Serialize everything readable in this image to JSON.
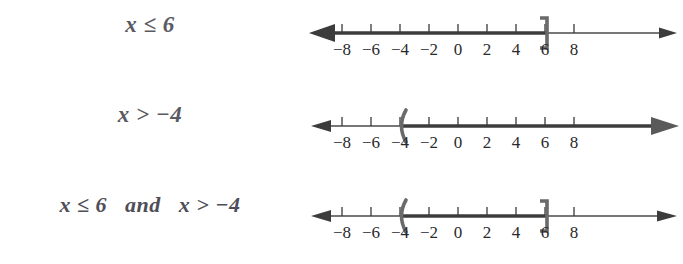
{
  "page": {
    "background_color": "#ffffff",
    "width": 683,
    "height": 264
  },
  "colors": {
    "expression_text": "#5a5a62",
    "axis_line": "#4a4a4a",
    "tick_label": "#2a2a2e",
    "highlight": "#3c3c3c",
    "bracket": "#6a6a6a"
  },
  "axis": {
    "tick_values": [
      -8,
      -6,
      -4,
      -2,
      0,
      2,
      4,
      6,
      8
    ],
    "tick_labels": [
      "−8",
      "−6",
      "−4",
      "−2",
      "0",
      "2",
      "4",
      "6",
      "8"
    ],
    "min_shown": -9.5,
    "max_shown": 9.5
  },
  "rows": [
    {
      "id": "row-0",
      "expression": "x ≤ 6",
      "inequality": {
        "variable": "x",
        "relation": "≤",
        "value": 6
      },
      "graph": {
        "type": "ray-left",
        "endpoint": 6,
        "endpoint_marker": "closed-bracket-right",
        "direction": "left",
        "arrow_left": true,
        "arrow_right": true,
        "shaded_from": "-infinity",
        "shaded_to": 6
      }
    },
    {
      "id": "row-1",
      "expression": "x > −4",
      "inequality": {
        "variable": "x",
        "relation": ">",
        "value": -4
      },
      "graph": {
        "type": "ray-right",
        "endpoint": -4,
        "endpoint_marker": "open-paren-left",
        "direction": "right",
        "arrow_left": true,
        "arrow_right": true,
        "shaded_from": -4,
        "shaded_to": "+infinity"
      }
    },
    {
      "id": "row-2",
      "expression": "x ≤ 6   and   x > −4",
      "inequality": {
        "variable": "x",
        "relation": "compound-and",
        "value_low": -4,
        "value_high": 6
      },
      "graph": {
        "type": "segment",
        "endpoint_low": -4,
        "endpoint_low_marker": "open-paren-left",
        "endpoint_high": 6,
        "endpoint_high_marker": "closed-bracket-right",
        "arrow_left": true,
        "arrow_right": true,
        "shaded_from": -4,
        "shaded_to": 6
      }
    }
  ]
}
